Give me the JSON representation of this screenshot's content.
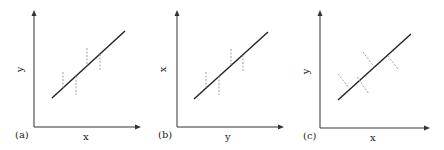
{
  "figure": {
    "panels": [
      {
        "id": "a",
        "label": "(a)",
        "xlabel": "x",
        "ylabel": "y",
        "residuals": "vertical"
      },
      {
        "id": "b",
        "label": "(b)",
        "xlabel": "y",
        "ylabel": "x",
        "residuals": "vertical"
      },
      {
        "id": "c",
        "label": "(c)",
        "xlabel": "x",
        "ylabel": "y",
        "residuals": "perpendicular"
      }
    ],
    "colors": {
      "axis": "#333333",
      "line": "#222222",
      "residual": "#888888"
    }
  }
}
